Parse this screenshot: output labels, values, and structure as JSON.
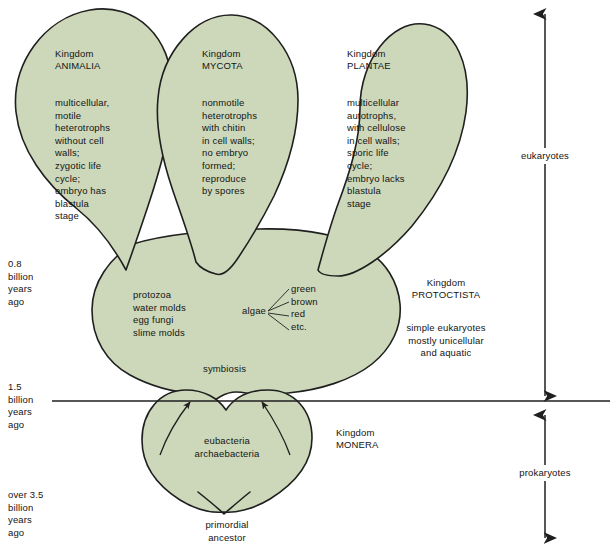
{
  "diagram": {
    "colors": {
      "organism_fill": "#ccd8b9",
      "outline": "#1f1f1f",
      "text": "#141414",
      "background": "#ffffff"
    },
    "kingdoms": [
      {
        "id": "animalia",
        "heading_line1": "Kingdom",
        "heading_line2": "ANIMALIA",
        "description": "multicellular,\nmotile\nheterotrophs\nwithout cell\nwalls;\nzygotic life\ncycle;\nembryo has\nblastula\nstage"
      },
      {
        "id": "mycota",
        "heading_line1": "Kingdom",
        "heading_line2": "MYCOTA",
        "description": "nonmotile\nheterotrophs\nwith chitin\nin cell walls;\nno embryo\nformed;\nreproduce\nby spores"
      },
      {
        "id": "plantae",
        "heading_line1": "Kingdom",
        "heading_line2": "PLANTAE",
        "description": "multicellular\nautotrophs,\nwith cellulose\nin cell walls;\nsporic life\ncycle;\nembryo lacks\nblastula\nstage"
      },
      {
        "id": "protoctista",
        "heading_line1": "Kingdom",
        "heading_line2": "PROTOCTISTA",
        "description": "simple eukaryotes\nmostly unicellular\nand aquatic"
      },
      {
        "id": "monera",
        "heading_line1": "Kingdom",
        "heading_line2": "MONERA",
        "description": ""
      }
    ],
    "protoctista_members": "protozoa\nwater molds\negg fungi\nslime molds",
    "algae_label": "algae",
    "algae_types": "green\nbrown\nred\netc.",
    "symbiosis_label": "symbiosis",
    "monera_members": "eubacteria\narchaebacteria",
    "primordial_label": "primordial\nancestor",
    "timeline": [
      {
        "id": "t-0-8",
        "text": "0.8\nbillion\nyears\nago"
      },
      {
        "id": "t-1-5",
        "text": "1.5\nbillion\nyears\nago"
      },
      {
        "id": "t-3-5",
        "text": "over 3.5\nbillion\nyears\nago"
      }
    ],
    "axis": {
      "eukaryotes_label": "eukaryotes",
      "prokaryotes_label": "prokaryotes"
    }
  }
}
